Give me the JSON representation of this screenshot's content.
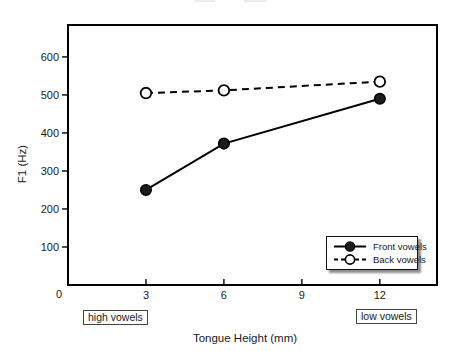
{
  "chart_data": {
    "type": "line",
    "x": [
      3,
      6,
      12
    ],
    "series": [
      {
        "name": "Front vowels",
        "values": [
          250,
          372,
          490
        ],
        "line_style": "solid",
        "marker": "filled-circle",
        "color": "#000000"
      },
      {
        "name": "Back vowels",
        "values": [
          505,
          512,
          535
        ],
        "line_style": "dashed",
        "marker": "open-circle",
        "color": "#000000"
      }
    ],
    "title": "",
    "xlabel": "Tongue Height (mm)",
    "ylabel": "F1 (Hz)",
    "x_ticks": [
      3,
      6,
      9,
      12
    ],
    "y_ticks": [
      100,
      200,
      300,
      400,
      500,
      600
    ],
    "origin_label": "0",
    "xlim": [
      0,
      14.2
    ],
    "ylim": [
      0,
      684
    ],
    "grid": false,
    "legend": {
      "position": "inside-bottom-right",
      "entries": [
        "Front vowels",
        "Back vowels"
      ]
    },
    "annotations": [
      {
        "text": "high vowels",
        "x": 3
      },
      {
        "text": "low vowels",
        "x": 12
      }
    ]
  },
  "colors": {
    "line": "#000000",
    "text": "#1a1a1a",
    "background": "#ffffff",
    "legend_shadow": "#999999"
  }
}
